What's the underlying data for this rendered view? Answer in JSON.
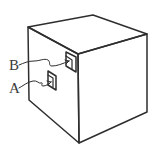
{
  "figure": {
    "stroke_color": "#2e2e2e",
    "background_color": "#ffffff"
  },
  "labels": {
    "b": "B",
    "a": "A"
  },
  "annotations": [
    {
      "label": "B",
      "target": "upper-opening-near-front-edge"
    },
    {
      "label": "A",
      "target": "lower-opening-on-left-face"
    }
  ]
}
